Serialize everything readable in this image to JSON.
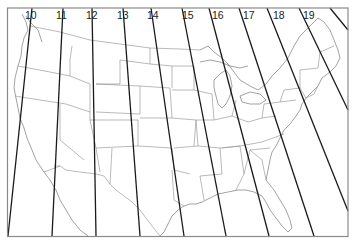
{
  "map": {
    "title": "",
    "colors": {
      "zone_line": "#1a1a1a",
      "boundary": "#8c8c8c",
      "frame": "#8a8a8a",
      "background": "#ffffff"
    },
    "zones": [
      {
        "label": "10",
        "label_x": 25
      },
      {
        "label": "11",
        "label_x": 56
      },
      {
        "label": "12",
        "label_x": 86
      },
      {
        "label": "13",
        "label_x": 117
      },
      {
        "label": "14",
        "label_x": 147
      },
      {
        "label": "15",
        "label_x": 182
      },
      {
        "label": "16",
        "label_x": 212
      },
      {
        "label": "17",
        "label_x": 243
      },
      {
        "label": "18",
        "label_x": 273
      },
      {
        "label": "19",
        "label_x": 303
      }
    ],
    "zone_lines": [
      {
        "x1": 32,
        "y1": 8,
        "x2": 8,
        "y2": 236
      },
      {
        "x1": 63,
        "y1": 8,
        "x2": 52,
        "y2": 236
      },
      {
        "x1": 92,
        "y1": 8,
        "x2": 96,
        "y2": 236
      },
      {
        "x1": 123,
        "y1": 8,
        "x2": 140,
        "y2": 236
      },
      {
        "x1": 151,
        "y1": 8,
        "x2": 184,
        "y2": 236
      },
      {
        "x1": 182,
        "y1": 8,
        "x2": 226,
        "y2": 236
      },
      {
        "x1": 209,
        "y1": 8,
        "x2": 269,
        "y2": 236
      },
      {
        "x1": 239,
        "y1": 8,
        "x2": 314,
        "y2": 236
      },
      {
        "x1": 267,
        "y1": 8,
        "x2": 348,
        "y2": 211
      },
      {
        "x1": 299,
        "y1": 8,
        "x2": 348,
        "y2": 110
      },
      {
        "x1": 330,
        "y1": 8,
        "x2": 348,
        "y2": 30
      }
    ]
  }
}
